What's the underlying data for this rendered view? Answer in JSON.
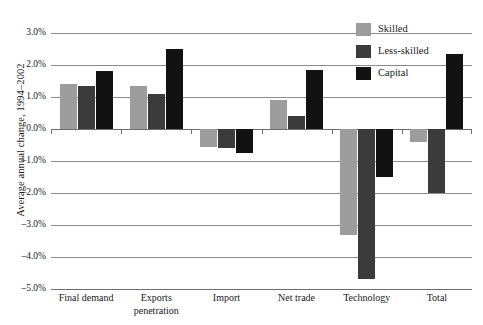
{
  "chart_data": {
    "type": "bar",
    "title": "",
    "subtitle": "",
    "xlabel": "",
    "ylabel": "Average annual change, 1994–2002",
    "categories": [
      "Final demand",
      "Exports penetration",
      "Import",
      "Net trade",
      "Technology",
      "Total"
    ],
    "category_lines": [
      [
        "Final demand"
      ],
      [
        "Exports",
        "penetration"
      ],
      [
        "Import"
      ],
      [
        "Net trade"
      ],
      [
        "Technology"
      ],
      [
        "Total"
      ]
    ],
    "series": [
      {
        "name": "Skilled",
        "color": "#9d9d9d",
        "values": [
          1.4,
          1.35,
          -0.55,
          0.9,
          -3.3,
          -0.4
        ]
      },
      {
        "name": "Less-skilled",
        "color": "#3b3b3b",
        "values": [
          1.35,
          1.1,
          -0.6,
          0.4,
          -4.7,
          -2.0
        ]
      },
      {
        "name": "Capital",
        "color": "#121212",
        "values": [
          1.8,
          2.5,
          -0.75,
          1.85,
          -1.5,
          2.35
        ]
      }
    ],
    "ylim": [
      -5.0,
      3.0
    ],
    "ytick_step": 1.0,
    "ytick_labels": [
      "3.0%",
      "2.0%",
      "1.0%",
      "0.0%",
      "–1.0%",
      "–2.0%",
      "–3.0%",
      "–4.0%",
      "–5.0%"
    ],
    "ytick_values": [
      3.0,
      2.0,
      1.0,
      0.0,
      -1.0,
      -2.0,
      -3.0,
      -4.0,
      -5.0
    ],
    "grid": true,
    "grid_axis": "y",
    "legend_position": "top-right",
    "legend": [
      "Skilled",
      "Less-skilled",
      "Capital"
    ],
    "value_format": "percent-1dp",
    "annotations": []
  },
  "legend": {
    "items": [
      {
        "label": "Skilled"
      },
      {
        "label": "Less-skilled"
      },
      {
        "label": "Capital"
      }
    ]
  },
  "axes": {
    "y_title": "Average annual change, 1994–2002"
  },
  "topstrip": {
    "text": ""
  }
}
